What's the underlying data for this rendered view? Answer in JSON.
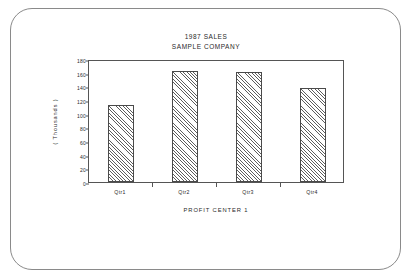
{
  "frame": {
    "style": "rounded-plotter-border",
    "border_color": "#8a8a8a",
    "background": "#ffffff"
  },
  "chart_data": {
    "type": "bar",
    "title": "1987 SALES",
    "subtitle": "SAMPLE COMPANY",
    "categories": [
      "Qtr1",
      "Qtr2",
      "Qtr3",
      "Qtr4"
    ],
    "values": [
      113,
      162,
      161,
      137
    ],
    "xlabel": "PROFIT CENTER 1",
    "ylabel": "( Thousands )",
    "ylim": [
      0,
      180
    ],
    "yticks": [
      0,
      20,
      40,
      60,
      80,
      100,
      120,
      140,
      160,
      180
    ],
    "ytick_labels": [
      "0",
      "20",
      "40",
      "60",
      "80",
      "100",
      "120",
      "140",
      "160",
      "180"
    ],
    "grid": false,
    "legend": false,
    "bar_fill": "diagonal-hatch",
    "bar_edge_color": "#4a4a4a",
    "axis_color": "#555555"
  }
}
